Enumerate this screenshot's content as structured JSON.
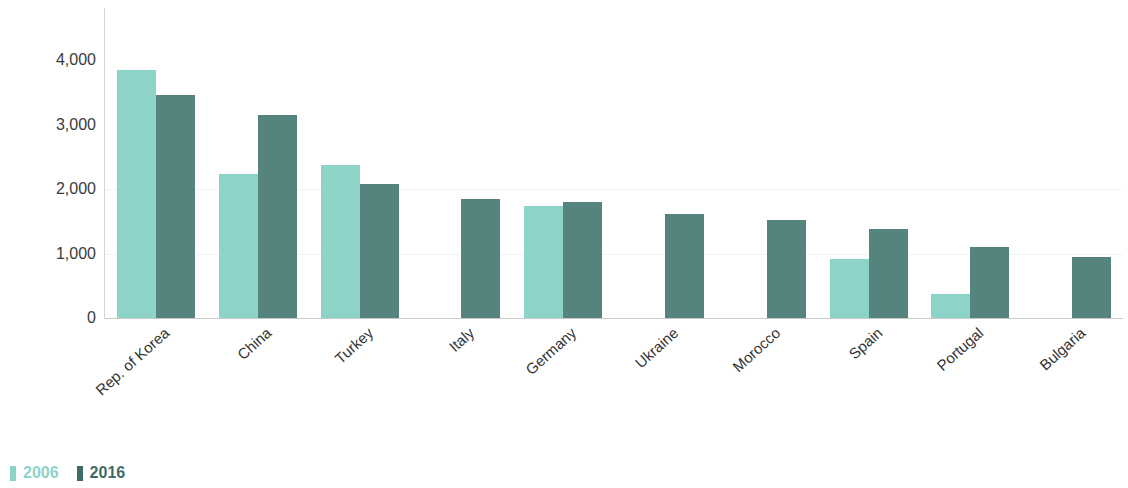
{
  "chart_data": {
    "type": "bar",
    "title": "",
    "xlabel": "",
    "ylabel": "Resident design count",
    "ylim": [
      0,
      4300
    ],
    "yticks": [
      "0",
      "1,000",
      "2,000",
      "3,000",
      "4,000"
    ],
    "ytick_values": [
      0,
      1000,
      2000,
      3000,
      4000
    ],
    "grid": false,
    "legend_position": "bottom-left",
    "categories": [
      "Rep. of Korea",
      "China",
      "Turkey",
      "Italy",
      "Germany",
      "Ukraine",
      "Morocco",
      "Spain",
      "Portugal",
      "Bulgaria"
    ],
    "series": [
      {
        "name": "2006",
        "color": "#8ed3c8",
        "values": [
          3850,
          2230,
          2370,
          null,
          1740,
          null,
          null,
          910,
          370,
          null
        ]
      },
      {
        "name": "2016",
        "color": "#55847f",
        "values": [
          3460,
          3150,
          2080,
          1850,
          1800,
          1620,
          1520,
          1380,
          1100,
          940
        ]
      }
    ]
  },
  "legend": {
    "items": [
      {
        "label": "2006",
        "color": "#8ed3c8"
      },
      {
        "label": "2016",
        "color": "#3f6c68"
      }
    ]
  },
  "axis": {
    "y_title": "Resident design count"
  }
}
